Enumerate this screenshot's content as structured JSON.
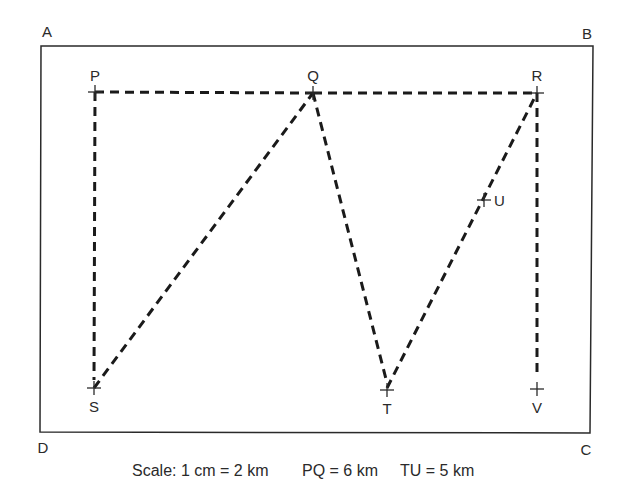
{
  "diagram": {
    "frame": {
      "corners": [
        {
          "id": "A",
          "label": "A",
          "x": 41,
          "y": 46,
          "lx": 47,
          "ly": 37
        },
        {
          "id": "B",
          "label": "B",
          "x": 593,
          "y": 46,
          "lx": 587,
          "ly": 39
        },
        {
          "id": "C",
          "label": "C",
          "x": 590,
          "y": 433,
          "lx": 586,
          "ly": 455
        },
        {
          "id": "D",
          "label": "D",
          "x": 40,
          "y": 432,
          "lx": 43,
          "ly": 453
        }
      ],
      "stroke": "#2a2a2a"
    },
    "points": [
      {
        "id": "P",
        "label": "P",
        "x": 95,
        "y": 92,
        "lx": 95,
        "ly": 81,
        "anchor": "middle"
      },
      {
        "id": "Q",
        "label": "Q",
        "x": 313,
        "y": 93,
        "lx": 313,
        "ly": 81,
        "anchor": "middle"
      },
      {
        "id": "R",
        "label": "R",
        "x": 537,
        "y": 93,
        "lx": 537,
        "ly": 81,
        "anchor": "middle"
      },
      {
        "id": "S",
        "label": "S",
        "x": 94,
        "y": 388,
        "lx": 94,
        "ly": 412,
        "anchor": "middle"
      },
      {
        "id": "T",
        "label": "T",
        "x": 387,
        "y": 390,
        "lx": 387,
        "ly": 414,
        "anchor": "middle"
      },
      {
        "id": "U",
        "label": "U",
        "x": 484,
        "y": 200,
        "lx": 494,
        "ly": 206,
        "anchor": "start"
      },
      {
        "id": "V",
        "label": "V",
        "x": 537,
        "y": 389,
        "lx": 537,
        "ly": 413,
        "anchor": "middle"
      }
    ],
    "paths": [
      {
        "id": "P-Q",
        "x1": 95,
        "y1": 92,
        "x2": 313,
        "y2": 93
      },
      {
        "id": "Q-R",
        "x1": 313,
        "y1": 93,
        "x2": 537,
        "y2": 93
      },
      {
        "id": "P-S",
        "x1": 95,
        "y1": 92,
        "x2": 94,
        "y2": 380
      },
      {
        "id": "S-Q",
        "x1": 94,
        "y1": 388,
        "x2": 313,
        "y2": 93
      },
      {
        "id": "Q-T",
        "x1": 313,
        "y1": 93,
        "x2": 387,
        "y2": 383
      },
      {
        "id": "T-R",
        "x1": 387,
        "y1": 388,
        "x2": 537,
        "y2": 93
      },
      {
        "id": "R-V",
        "x1": 537,
        "y1": 93,
        "x2": 537,
        "y2": 376
      }
    ],
    "dash_color": "#1a1a1a",
    "caption": {
      "scale": "Scale: 1 cm = 2 km",
      "pq": "PQ = 6 km",
      "tu": "TU = 5 km"
    }
  }
}
